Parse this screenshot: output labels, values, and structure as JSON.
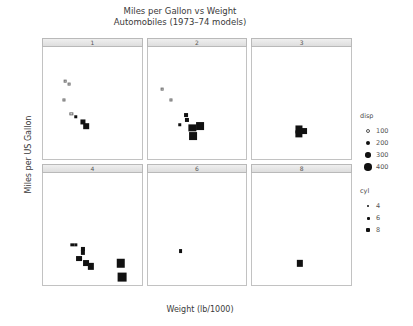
{
  "chart_data": {
    "type": "scatter",
    "title": "Miles per Gallon vs Weight",
    "subtitle": "Automobiles (1973–74 models)",
    "xlabel": "Weight (lb/1000)",
    "ylabel": "Miles per US Gallon",
    "xlim": [
      1,
      6.4
    ],
    "ylim": [
      8,
      44
    ],
    "xticks": [
      2,
      4,
      6
    ],
    "yticks": [
      10,
      20,
      30,
      40
    ],
    "grid": false,
    "facet_layout": {
      "rows": 2,
      "cols": 3
    },
    "size_encoding": "disp",
    "color_encoding": "cyl",
    "panels": [
      {
        "strip_label": "1",
        "row": 0,
        "col": 0,
        "points": [
          {
            "x": 2.2,
            "y": 33.0,
            "disp": 71,
            "cyl": 4
          },
          {
            "x": 2.45,
            "y": 32.0,
            "disp": 79,
            "cyl": 4
          },
          {
            "x": 2.15,
            "y": 27.0,
            "disp": 95,
            "cyl": 4
          },
          {
            "x": 2.55,
            "y": 22.5,
            "disp": 108,
            "cyl": 4
          },
          {
            "x": 2.8,
            "y": 21.5,
            "disp": 120,
            "cyl": 4
          },
          {
            "x": 3.2,
            "y": 20.0,
            "disp": 225,
            "cyl": 6
          },
          {
            "x": 3.35,
            "y": 18.5,
            "disp": 258,
            "cyl": 6
          }
        ]
      },
      {
        "strip_label": "2",
        "row": 0,
        "col": 1,
        "points": [
          {
            "x": 1.8,
            "y": 30.5,
            "disp": 75,
            "cyl": 4
          },
          {
            "x": 2.3,
            "y": 27.0,
            "disp": 95,
            "cyl": 4
          },
          {
            "x": 3.1,
            "y": 22.0,
            "disp": 146,
            "cyl": 4
          },
          {
            "x": 3.15,
            "y": 20.5,
            "disp": 160,
            "cyl": 6
          },
          {
            "x": 2.75,
            "y": 19.0,
            "disp": 121,
            "cyl": 4
          },
          {
            "x": 3.45,
            "y": 18.0,
            "disp": 360,
            "cyl": 8
          },
          {
            "x": 3.85,
            "y": 18.5,
            "disp": 400,
            "cyl": 8
          },
          {
            "x": 3.5,
            "y": 15.5,
            "disp": 400,
            "cyl": 8
          }
        ]
      },
      {
        "strip_label": "3",
        "row": 0,
        "col": 2,
        "points": [
          {
            "x": 3.55,
            "y": 17.5,
            "disp": 350,
            "cyl": 8
          },
          {
            "x": 3.85,
            "y": 17.0,
            "disp": 275,
            "cyl": 8
          },
          {
            "x": 3.55,
            "y": 16.0,
            "disp": 360,
            "cyl": 8
          }
        ]
      },
      {
        "strip_label": "4",
        "row": 1,
        "col": 0,
        "points": [
          {
            "x": 2.6,
            "y": 21.0,
            "disp": 110,
            "cyl": 4
          },
          {
            "x": 2.8,
            "y": 21.0,
            "disp": 110,
            "cyl": 4
          },
          {
            "x": 3.2,
            "y": 19.5,
            "disp": 160,
            "cyl": 6
          },
          {
            "x": 3.2,
            "y": 18.5,
            "disp": 167,
            "cyl": 6
          },
          {
            "x": 2.95,
            "y": 16.5,
            "disp": 275,
            "cyl": 8
          },
          {
            "x": 3.35,
            "y": 15.0,
            "disp": 275,
            "cyl": 8
          },
          {
            "x": 3.6,
            "y": 14.0,
            "disp": 300,
            "cyl": 8
          },
          {
            "x": 5.25,
            "y": 15.0,
            "disp": 440,
            "cyl": 8
          },
          {
            "x": 5.35,
            "y": 10.5,
            "disp": 460,
            "cyl": 8
          }
        ]
      },
      {
        "strip_label": "6",
        "row": 1,
        "col": 1,
        "points": [
          {
            "x": 2.8,
            "y": 19.0,
            "disp": 145,
            "cyl": 6
          }
        ]
      },
      {
        "strip_label": "8",
        "row": 1,
        "col": 2,
        "points": [
          {
            "x": 3.6,
            "y": 15.0,
            "disp": 301,
            "cyl": 8
          }
        ]
      }
    ],
    "legends": [
      {
        "title": "disp",
        "entries": [
          {
            "label": "100",
            "size": 2
          },
          {
            "label": "200",
            "size": 4
          },
          {
            "label": "300",
            "size": 5.5
          },
          {
            "label": "400",
            "size": 7.5
          }
        ]
      },
      {
        "title": "cyl",
        "entries": [
          {
            "label": "4",
            "size": 2.5
          },
          {
            "label": "6",
            "size": 3
          },
          {
            "label": "8",
            "size": 4
          }
        ]
      }
    ]
  }
}
